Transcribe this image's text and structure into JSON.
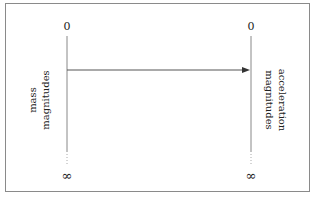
{
  "diagram": {
    "type": "mapping",
    "left_axis": {
      "label_line1": "mass",
      "label_line2": "magnitudes",
      "top_value": "0",
      "bottom_value": "∞"
    },
    "right_axis": {
      "label_line1": "acceleration",
      "label_line2": "magnitudes",
      "top_value": "0",
      "bottom_value": "∞"
    },
    "arrow": {
      "from": "mass magnitudes",
      "to": "acceleration magnitudes"
    },
    "colors": {
      "line": "#777777",
      "text": "#222222",
      "frame": "#8a8a8a"
    }
  }
}
